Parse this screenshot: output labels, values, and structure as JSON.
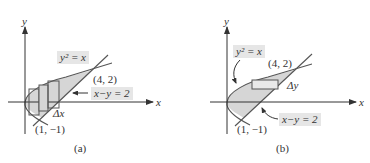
{
  "figure": {
    "panels": [
      {
        "id": "a",
        "caption": "(a)",
        "axis_x_label": "x",
        "axis_y_label": "y",
        "curve_label": "y² = x",
        "line_label": "x−y = 2",
        "point_upper": "(4, 2)",
        "point_lower": "(1, −1)",
        "strip_label": "Δx",
        "strip_orientation": "vertical"
      },
      {
        "id": "b",
        "caption": "(b)",
        "axis_x_label": "x",
        "axis_y_label": "y",
        "curve_label": "y² = x",
        "line_label": "x−y = 2",
        "point_upper": "(4, 2)",
        "point_lower": "(1, −1)",
        "strip_label": "Δy",
        "strip_orientation": "horizontal"
      }
    ],
    "colors": {
      "region_fill": "#d6d6d6",
      "stroke": "#555555",
      "label_bg": "#e6e6e6",
      "text": "#333333"
    }
  }
}
